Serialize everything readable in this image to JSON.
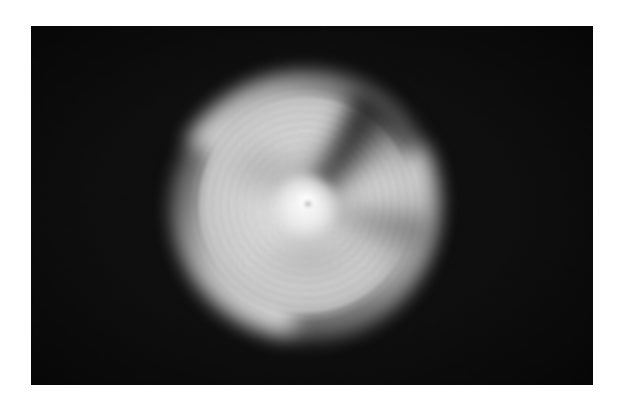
{
  "image": {
    "title": "Long-exposure photograph of a rapidly spinning disc",
    "subject": "spinning-disc",
    "medium": "photograph",
    "presentation": "white mat border around a rectangular photographic print",
    "canvas": {
      "width": 624,
      "height": 409
    },
    "photo_frame": {
      "left": 31,
      "top": 26,
      "width": 562,
      "height": 359
    },
    "border": {
      "style": "solid white mat",
      "color": "#ffffff",
      "top": 26,
      "left": 31,
      "right": 31,
      "bottom": 24
    }
  },
  "scene": {
    "background": {
      "name": "dark-field-background",
      "description": "near-black, featureless field filling the photographic frame",
      "color": "#090909",
      "texture": "fine photographic grain / sensor noise",
      "vignette": true
    },
    "subject": {
      "name": "spinning-disc",
      "description": "A bright, pale-grey circular object photographed mid-rotation, producing heavy radial motion blur. Concentric groove-like rings radiate from a brilliant white hub, and three soft pinwheel lobes of flung light fan outward from the body.",
      "center": {
        "x": 306,
        "y": 205
      },
      "bright_core": {
        "x": 309,
        "y": 203,
        "radius_px": 11,
        "color": "#fdfdfd"
      },
      "body_radius_px": 107,
      "halo_radius_px": 135,
      "bounding_box": {
        "left": 175,
        "top": 85,
        "right": 425,
        "bottom": 340
      },
      "motion": "rotational / spin blur about the central hub"
    }
  },
  "features": [
    {
      "name": "central-hub",
      "label": "Bright white spindle hub at the axis of rotation",
      "tone": "#fdfdfd",
      "angle_deg": null
    },
    {
      "name": "concentric-rings",
      "label": "Fine concentric groove rings, record-like, smeared by rotation",
      "tone": "#d8d8d8",
      "angle_deg": null
    },
    {
      "name": "pinwheel-lobe-upper-left",
      "label": "Swept motion-blur lobe fanning toward the upper left",
      "tone": "#e1e1e1",
      "angle_deg": 186
    },
    {
      "name": "pinwheel-lobe-right",
      "label": "Swept motion-blur lobe fanning toward the right",
      "tone": "#dcdcdc",
      "angle_deg": 300
    },
    {
      "name": "pinwheel-lobe-lower-left",
      "label": "Swept motion-blur lobe fanning toward the lower left",
      "tone": "#dedede",
      "angle_deg": 64
    },
    {
      "name": "dark-notch-upper-right",
      "label": "Dark wedge-shaped bite cut into the upper-right rim",
      "tone": "#090909",
      "angle_deg": 24
    },
    {
      "name": "dark-notch-lower",
      "label": "Softer dark indentation along the lower rim",
      "tone": "#0c0c0c",
      "angle_deg": 96
    },
    {
      "name": "grey-smudge-upper",
      "label": "Broad grey smudge smeared above the hub",
      "tone": "#8e8e8e",
      "angle_deg": null
    },
    {
      "name": "grey-smudge-upper-left",
      "label": "Broad grey smudge smeared to the upper left of the hub",
      "tone": "#929292",
      "angle_deg": null
    },
    {
      "name": "grey-smudge-lower",
      "label": "Broad grey smudge smeared below the hub",
      "tone": "#8a8a8a",
      "angle_deg": null
    }
  ],
  "palette": {
    "mat_white": "#ffffff",
    "field_black": "#090909",
    "core_white": "#fdfdfd",
    "body_light": "#ececec",
    "body_mid": "#d6d6d6",
    "halo_grey": "#a5a5a5",
    "smudge_grey": "#8e8e8e"
  }
}
